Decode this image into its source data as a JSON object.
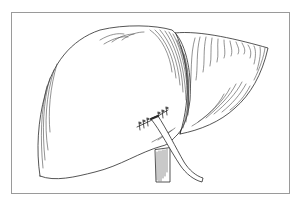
{
  "illustration": {
    "subject": "liver with sutured incision and drain tube",
    "style": "black-and-white line drawing with hatching",
    "elements": [
      "frame",
      "left-lobe",
      "right-lobe",
      "suture-line",
      "drain-tube",
      "vessel"
    ],
    "colors": {
      "ink": "#2a2a2a",
      "frame": "#9a9a9a",
      "background": "#ffffff"
    }
  }
}
